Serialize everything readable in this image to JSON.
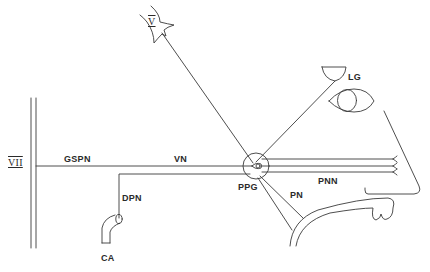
{
  "diagram": {
    "type": "anatomical-nerve-pathway",
    "background": "#ffffff",
    "stroke_color": "#3a3a3a",
    "labels": {
      "cranial_nerve_v": "V",
      "cranial_nerve_vii": "VII",
      "gspn": "GSPN",
      "vn": "VN",
      "dpn": "DPN",
      "ca": "CA",
      "ppg": "PPG",
      "pn": "PN",
      "pnn": "PNN",
      "lg": "LG"
    },
    "structures": [
      {
        "id": "trigeminal",
        "label": "V",
        "icon": "branching-nerve-icon"
      },
      {
        "id": "facial-nerve",
        "label": "VII",
        "icon": "double-vertical-line"
      },
      {
        "id": "greater-superficial-petrosal-nerve",
        "label": "GSPN"
      },
      {
        "id": "vidian-nerve",
        "label": "VN"
      },
      {
        "id": "deep-petrosal-nerve",
        "label": "DPN"
      },
      {
        "id": "carotid-artery",
        "label": "CA",
        "icon": "curved-tube-icon"
      },
      {
        "id": "pterygopalatine-ganglion",
        "label": "PPG",
        "icon": "circle-ganglion-icon"
      },
      {
        "id": "palatine-nerve",
        "label": "PN"
      },
      {
        "id": "posterior-nasal-nerves",
        "label": "PNN"
      },
      {
        "id": "lacrimal-gland",
        "label": "LG",
        "icon": "gland-cup-icon"
      },
      {
        "id": "eye",
        "icon": "eye-icon"
      },
      {
        "id": "nasal-profile",
        "icon": "nose-outline"
      },
      {
        "id": "palate",
        "icon": "palate-outline"
      }
    ]
  }
}
